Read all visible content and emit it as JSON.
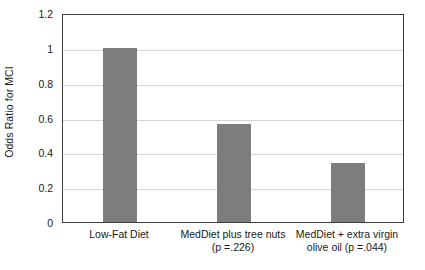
{
  "chart_data": {
    "type": "bar",
    "title": "",
    "subtitle": "",
    "xlabel": "",
    "ylabel": "Odds Ratio for MCI",
    "ylim": [
      0,
      1.2
    ],
    "ytick_values": [
      0,
      0.2,
      0.4,
      0.6,
      0.8,
      1,
      1.2
    ],
    "ytick_labels": [
      "0",
      "0.2",
      "0.4",
      "0.6",
      "0.8",
      "1",
      "1.2"
    ],
    "grid": "horizontal",
    "legend": "none",
    "categories": [
      "Low-Fat Diet",
      "MedDiet plus tree nuts (p =.226)",
      "MedDiet + extra virgin olive oil (p =.044)"
    ],
    "category_label_lines": [
      [
        "Low-Fat Diet"
      ],
      [
        "MedDiet plus tree nuts",
        "(p =.226)"
      ],
      [
        "MedDiet + extra virgin",
        "olive oil (p =.044)"
      ]
    ],
    "values": [
      1,
      0.56,
      0.34
    ],
    "annotations": [
      {
        "category": "MedDiet plus tree nuts",
        "p_value": ".226"
      },
      {
        "category": "MedDiet + extra virgin olive oil",
        "p_value": ".044"
      }
    ],
    "bar_color": "#7d7d7d",
    "axis_color": "#3d3d3d",
    "gridline_color": "#d4d4d4",
    "background_color": "#ffffff"
  }
}
